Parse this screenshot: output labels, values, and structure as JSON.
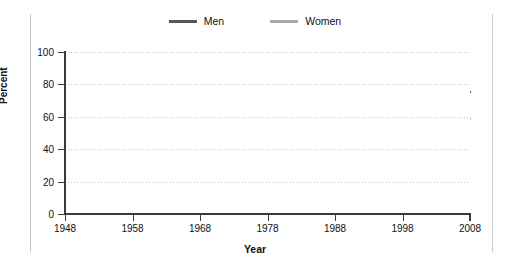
{
  "chart_data": {
    "type": "line",
    "title": "",
    "xlabel": "Year",
    "ylabel": "Percent",
    "xlim": [
      1948,
      2008
    ],
    "ylim": [
      0,
      100
    ],
    "xticks": [
      1948,
      1958,
      1968,
      1978,
      1988,
      1998,
      2008
    ],
    "yticks": [
      0,
      20,
      40,
      60,
      80,
      100
    ],
    "grid": true,
    "legend_position": "top-center",
    "colors": {
      "men": "#555555",
      "women": "#aaaaaa",
      "grid": "#c6c6c6",
      "axis": "#3a3a3a"
    },
    "x": [
      1948,
      1949,
      1950,
      1951,
      1952,
      1953,
      1954,
      1955,
      1956,
      1957,
      1958,
      1959,
      1960,
      1961,
      1962,
      1963,
      1964,
      1965,
      1966,
      1967,
      1968,
      1969,
      1970,
      1971,
      1972,
      1973,
      1974,
      1975,
      1976,
      1977,
      1978,
      1979,
      1980,
      1981,
      1982,
      1983,
      1984,
      1985,
      1986,
      1987,
      1988,
      1989,
      1990,
      1991,
      1992,
      1993,
      1994,
      1995,
      1996,
      1997,
      1998,
      1999,
      2000,
      2001,
      2002,
      2003,
      2004,
      2005,
      2006,
      2007,
      2008
    ],
    "series": [
      {
        "name": "Men",
        "color": "#555555",
        "values": [
          86.9,
          86.7,
          86.8,
          87.0,
          86.9,
          86.5,
          85.9,
          85.8,
          85.8,
          85.3,
          85.0,
          84.5,
          84.0,
          83.6,
          82.8,
          82.2,
          81.9,
          81.5,
          81.4,
          81.5,
          81.2,
          81.0,
          80.6,
          80.0,
          79.7,
          79.5,
          79.4,
          78.5,
          78.3,
          78.5,
          78.4,
          78.5,
          78.2,
          77.9,
          77.2,
          76.9,
          77.0,
          77.0,
          77.3,
          77.4,
          77.4,
          77.5,
          77.4,
          76.7,
          76.5,
          76.1,
          76.0,
          75.9,
          75.8,
          76.0,
          76.0,
          75.9,
          75.9,
          75.5,
          75.3,
          74.9,
          74.8,
          74.8,
          75.0,
          75.2,
          75.3
        ]
      },
      {
        "name": "Women",
        "color": "#aaaaaa",
        "values": [
          32.3,
          32.9,
          33.5,
          34.3,
          34.5,
          34.2,
          34.3,
          35.3,
          36.2,
          36.5,
          36.6,
          36.8,
          37.2,
          37.6,
          37.5,
          37.8,
          38.2,
          38.8,
          39.7,
          40.5,
          41.1,
          41.8,
          42.9,
          42.9,
          43.5,
          44.3,
          45.2,
          45.9,
          46.8,
          47.9,
          49.4,
          50.6,
          51.3,
          52.1,
          52.9,
          53.5,
          54.0,
          54.7,
          55.4,
          56.2,
          57.0,
          57.7,
          57.9,
          57.6,
          57.6,
          57.6,
          58.6,
          58.7,
          59.0,
          59.5,
          59.6,
          59.8,
          60.2,
          60.0,
          59.8,
          59.5,
          59.2,
          59.0,
          58.9,
          58.8,
          58.9
        ]
      }
    ]
  },
  "legend": {
    "items": [
      {
        "label": "Men",
        "color": "#555555"
      },
      {
        "label": "Women",
        "color": "#aaaaaa"
      }
    ]
  },
  "axes": {
    "y_title": "Percent",
    "x_title": "Year",
    "y_tick_labels": [
      "0",
      "20",
      "40",
      "60",
      "80",
      "100"
    ],
    "x_tick_labels": [
      "1948",
      "1958",
      "1968",
      "1978",
      "1988",
      "1998",
      "2008"
    ]
  }
}
